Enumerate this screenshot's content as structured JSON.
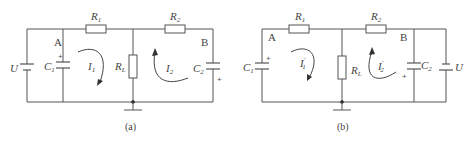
{
  "diagram_a": {
    "caption": "(a)",
    "labels": {
      "R1": "R",
      "R1_sub": "1",
      "R2": "R",
      "R2_sub": "2",
      "RL": "R",
      "RL_sub": "L",
      "C1": "C",
      "C1_sub": "1",
      "C2": "C",
      "C2_sub": "2",
      "U": "U",
      "node_A": "A",
      "node_B": "B",
      "I1": "I",
      "I1_sub": "1",
      "I2": "I",
      "I2_sub": "2",
      "plus": "+"
    }
  },
  "diagram_b": {
    "caption": "(b)",
    "labels": {
      "R1": "R",
      "R1_sub": "1",
      "R2": "R",
      "R2_sub": "2",
      "RL": "R",
      "RL_sub": "L",
      "C1": "C",
      "C1_sub": "1",
      "C2": "C",
      "C2_sub": "2",
      "U": "U",
      "node_A": "A",
      "node_B": "B",
      "I1": "I",
      "I1_sub": "1",
      "I1_prime": "′",
      "I2": "I",
      "I2_sub": "2",
      "I2_prime": "′",
      "plus": "+"
    }
  },
  "colors": {
    "wire": "#555555",
    "text": "#444444",
    "background": "#ffffff"
  }
}
